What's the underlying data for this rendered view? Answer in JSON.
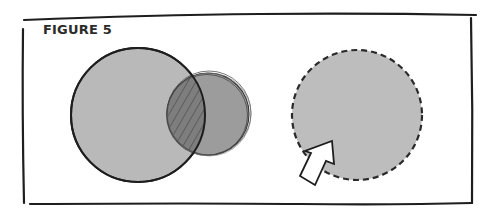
{
  "figure": {
    "label": "FIGURE 5"
  },
  "colors": {
    "frame_stroke": "#1e1e1e",
    "circle_fill_light": "#b9b9b9",
    "circle_fill_dark": "#9a9a9a",
    "overlap_fill": "#7d7d7d",
    "hatch": "#5a5a5a",
    "dashed_fill": "#bdbdbd",
    "cursor_fill": "#ffffff"
  },
  "shapes": {
    "left_circle": {
      "cx": 138,
      "cy": 115,
      "r": 67,
      "style": "solid outline"
    },
    "overlap_circle": {
      "cx": 208,
      "cy": 114,
      "r": 41,
      "style": "sketchy outline, hatched intersection"
    },
    "dashed_circle": {
      "cx": 357,
      "cy": 115,
      "r": 65,
      "style": "dashed outline"
    },
    "cursor_icon": "arrow-pointer pointing up-right into dashed circle"
  }
}
